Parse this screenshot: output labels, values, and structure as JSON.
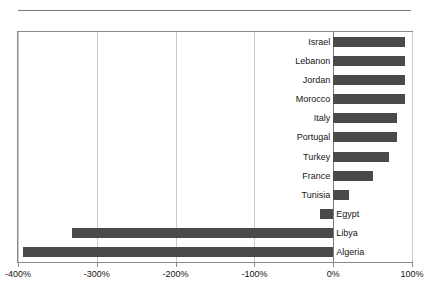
{
  "chart_data": {
    "type": "bar",
    "orientation": "horizontal",
    "title": "",
    "xlabel": "",
    "ylabel": "",
    "xlim": [
      -400,
      100
    ],
    "xticks": [
      -400,
      -300,
      -200,
      -100,
      0,
      100
    ],
    "xtick_labels": [
      "-400%",
      "-300%",
      "-200%",
      "-100%",
      "0%",
      "100%"
    ],
    "grid": true,
    "grid_axis": "x",
    "legend": false,
    "bar_color": "#4a4a4a",
    "categories": [
      "Israel",
      "Lebanon",
      "Jordan",
      "Morocco",
      "Italy",
      "Portugal",
      "Turkey",
      "France",
      "Tunisia",
      "Egypt",
      "Libya",
      "Algeria"
    ],
    "values": [
      91,
      91,
      91,
      91,
      81,
      81,
      71,
      50,
      20,
      -17,
      -331,
      -394
    ],
    "value_labels": [
      "91%",
      "91%",
      "91%",
      "91%",
      "81%",
      "81%",
      "71%",
      "50%",
      "20%",
      "-17%",
      "-331%",
      "-394%"
    ]
  }
}
